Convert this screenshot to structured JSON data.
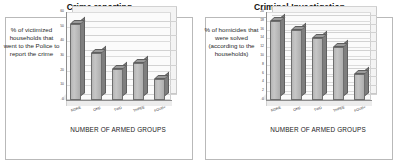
{
  "figure": {
    "panels": [
      {
        "id": "crime-reporting",
        "title": "Crime reporting",
        "side_label": "% of victimized households that went to the Police to report the crime",
        "axis_title": "NUMBER OF ARMED GROUPS",
        "chart_data": {
          "type": "bar",
          "title": "Crime reporting",
          "categories": [
            "NONE",
            "ONE",
            "TWO",
            "THREE",
            "FOUR+"
          ],
          "values": [
            52,
            32,
            21,
            25,
            14
          ],
          "xlabel": "NUMBER OF ARMED GROUPS",
          "ylabel": "% of victimized households that went to the Police to report the crime",
          "ylim": [
            0,
            60
          ],
          "yticks": [
            0,
            10,
            20,
            30,
            40,
            50,
            60
          ],
          "grid": true,
          "legend": "none",
          "style": "3d-column",
          "bar_color": "#b6b6b6"
        }
      },
      {
        "id": "criminal-investigation",
        "title": "Criminal Investigation",
        "side_label": "% of homicides that were solved (according to the households)",
        "axis_title": "NUMBER OF ARMED GROUPS",
        "chart_data": {
          "type": "bar",
          "title": "Criminal Investigation",
          "categories": [
            "NONE",
            "ONE",
            "TWO",
            "THREE",
            "FOUR+"
          ],
          "values": [
            18,
            16,
            14,
            12,
            6
          ],
          "xlabel": "NUMBER OF ARMED GROUPS",
          "ylabel": "% of homicides that were solved (according to the households)",
          "ylim": [
            0,
            20
          ],
          "yticks": [
            0,
            2,
            4,
            6,
            8,
            10,
            12,
            14,
            16,
            18,
            20
          ],
          "grid": true,
          "legend": "none",
          "style": "3d-column",
          "bar_color": "#b6b6b6"
        }
      }
    ]
  }
}
